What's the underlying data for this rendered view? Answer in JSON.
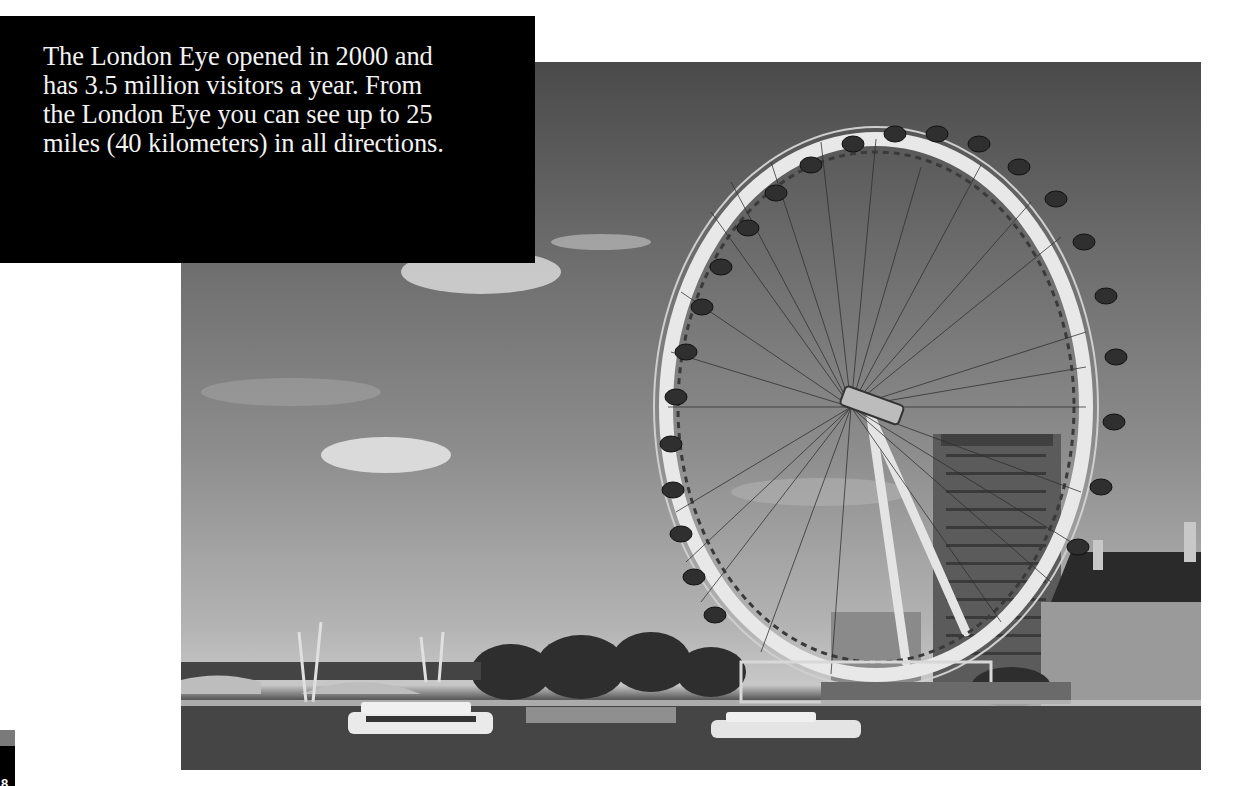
{
  "caption": {
    "text": "The London Eye opened in 2000 and has 3.5 million visitors a year. From the London Eye you can see up to 25 miles (40 kilometers) in all directions.",
    "lines": [
      "The London Eye opened in 2000 and",
      "has 3.5 million visitors a year. From",
      "the London Eye you can see up to 25",
      "miles (40 kilometers) in all directions."
    ]
  },
  "photo": {
    "subject": "London Eye ferris wheel on the River Thames",
    "style": "grayscale",
    "elements": [
      "sky-with-clouds",
      "ferris-wheel",
      "office-tower",
      "county-hall-building",
      "bridge",
      "trees",
      "river",
      "tour-boats"
    ]
  },
  "page": {
    "number": "8",
    "tab_colors": {
      "top": "#7a7a7a",
      "bottom": "#000000"
    }
  },
  "colors": {
    "caption_background": "#000000",
    "caption_text": "#f2f2f2",
    "page_background": "#ffffff"
  }
}
